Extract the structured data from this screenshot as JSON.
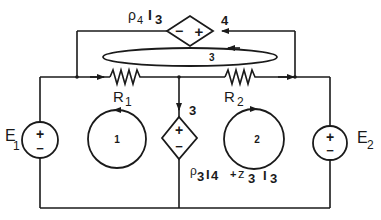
{
  "diagram": {
    "type": "circuit",
    "colors": {
      "ink": "#1a1a1a",
      "background": "#ffffff"
    },
    "sources": {
      "E1": {
        "label": "E",
        "subscript": "1",
        "plus": "+",
        "minus": "−"
      },
      "E2": {
        "label": "E",
        "subscript": "2",
        "plus": "+",
        "minus": "−"
      }
    },
    "resistors": {
      "R1": {
        "label": "R",
        "subscript": "1"
      },
      "R2": {
        "label": "R",
        "subscript": "2"
      }
    },
    "dependent_sources": {
      "top": {
        "expr_p": "ρ",
        "expr_sub": "4",
        "expr_i": "I",
        "expr_isub": "3",
        "minus": "−",
        "plus": "+",
        "branch_label": "4"
      },
      "middle": {
        "plus": "+",
        "minus": "−",
        "branch_label": "3",
        "expr_p": "ρ",
        "expr_psub": "3",
        "expr_i1": "I",
        "expr_i1sub": "4",
        "expr_plus": "+",
        "expr_z": "z",
        "expr_zsub": "3",
        "expr_i2": "I",
        "expr_i2sub": "3"
      }
    },
    "loops": {
      "loop1": "1",
      "loop2": "2",
      "loop3": "3"
    }
  }
}
